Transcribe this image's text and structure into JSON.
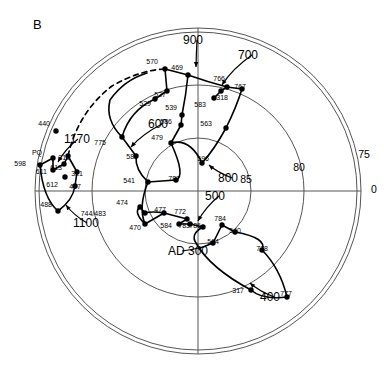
{
  "figure": {
    "panel_label": "B",
    "type": "polar-apw-plot",
    "center_px": [
      198,
      191
    ],
    "outer_radius_px": 163
  },
  "chart_data": {
    "type": "scatter",
    "title": "B",
    "projection": "polar-stereographic",
    "xlabel": "",
    "ylabel": "",
    "grid": true,
    "legend_position": "none",
    "axis_rings": [
      {
        "label": "85",
        "latitude": 85,
        "radius_px": 53,
        "label_px": [
          246,
          183
        ]
      },
      {
        "label": "80",
        "latitude": 80,
        "radius_px": 106,
        "label_px": [
          299,
          171
        ]
      },
      {
        "label": "75",
        "latitude": 75,
        "radius_px": 159,
        "label_px": [
          364,
          158
        ]
      }
    ],
    "axis_origin_label": {
      "label": "0",
      "px": [
        371,
        193
      ]
    },
    "era_labels": [
      {
        "label": "900",
        "px": [
          183,
          44
        ],
        "leader_to": [
          196,
          67
        ]
      },
      {
        "label": "700",
        "px": [
          238,
          59
        ],
        "leader_to": [
          222,
          85
        ]
      },
      {
        "label": "600",
        "px": [
          148,
          128
        ],
        "leader_to": [
          131,
          147
        ]
      },
      {
        "label": "800",
        "px": [
          218,
          182
        ],
        "leader_to": [
          209,
          165
        ]
      },
      {
        "label": "500",
        "px": [
          205,
          200
        ],
        "leader_to": [
          198,
          221
        ]
      },
      {
        "label": "400",
        "px": [
          260,
          301
        ],
        "leader_to": [
          250,
          283
        ]
      },
      {
        "label": "1170",
        "px": [
          64,
          143
        ],
        "leader_to": [
          58,
          162
        ]
      },
      {
        "label": "1100",
        "px": [
          73,
          227
        ],
        "leader_to": [
          66,
          205
        ]
      },
      {
        "label": "AD 300",
        "px": [
          168,
          255
        ],
        "leader_to": [
          203,
          247
        ]
      }
    ],
    "points": [
      {
        "label": "570",
        "px": [
          165,
          69
        ],
        "label_px": [
          158,
          64
        ]
      },
      {
        "label": "469",
        "px": [
          188,
          75
        ],
        "label_px": [
          183,
          70
        ]
      },
      {
        "label": "766",
        "px": [
          227,
          87
        ],
        "label_px": [
          225,
          81
        ]
      },
      {
        "label": "767",
        "px": [
          242,
          89
        ],
        "label_px": [
          246,
          89
        ]
      },
      {
        "label": "318",
        "px": [
          221,
          91
        ],
        "label_px": [
          228,
          100
        ]
      },
      {
        "label": "583",
        "px": [
          214,
          98
        ],
        "label_px": [
          206,
          107
        ]
      },
      {
        "label": "527",
        "px": [
          167,
          91
        ],
        "label_px": [
          166,
          97
        ]
      },
      {
        "label": "529",
        "px": [
          155,
          99
        ],
        "label_px": [
          151,
          106
        ]
      },
      {
        "label": "539",
        "px": [
          182,
          115
        ],
        "label_px": [
          177,
          110
        ]
      },
      {
        "label": "586",
        "px": [
          181,
          125
        ],
        "label_px": [
          172,
          124
        ]
      },
      {
        "label": "563",
        "px": [
          226,
          128
        ],
        "label_px": [
          212,
          126
        ]
      },
      {
        "label": "479",
        "px": [
          171,
          143
        ],
        "label_px": [
          163,
          140
        ]
      },
      {
        "label": "775",
        "px": [
          122,
          137
        ],
        "label_px": [
          106,
          145
        ]
      },
      {
        "label": "585",
        "px": [
          136,
          156
        ],
        "label_px": [
          138,
          159
        ]
      },
      {
        "label": "596",
        "px": [
          202,
          163
        ],
        "label_px": [
          209,
          161
        ]
      },
      {
        "label": "541",
        "px": [
          148,
          182
        ],
        "label_px": [
          135,
          183
        ]
      },
      {
        "label": "787",
        "px": [
          176,
          180
        ],
        "label_px": [
          180,
          181
        ]
      },
      {
        "label": "440",
        "px": [
          56,
          131
        ],
        "label_px": [
          50,
          126
        ]
      },
      {
        "label": "PQ",
        "px": [
          53,
          158
        ],
        "label_px": [
          42,
          155
        ]
      },
      {
        "label": "598",
        "px": [
          40,
          165
        ],
        "label_px": [
          26,
          166
        ]
      },
      {
        "label": "611",
        "px": [
          53,
          170
        ],
        "label_px": [
          47,
          174
        ]
      },
      {
        "label": "613",
        "px": [
          64,
          164
        ],
        "label_px": [
          62,
          170
        ]
      },
      {
        "label": "319",
        "px": [
          68,
          156
        ],
        "label_px": [
          70,
          160
        ]
      },
      {
        "label": "321",
        "px": [
          77,
          172
        ],
        "label_px": [
          83,
          176
        ]
      },
      {
        "label": "612",
        "px": [
          65,
          177
        ],
        "label_px": [
          58,
          187
        ]
      },
      {
        "label": "407",
        "px": [
          75,
          186
        ],
        "label_px": [
          81,
          189
        ]
      },
      {
        "label": "488",
        "px": [
          58,
          211
        ],
        "label_px": [
          52,
          207
        ]
      },
      {
        "label": "474",
        "px": [
          140,
          207
        ],
        "label_px": [
          128,
          205
        ]
      },
      {
        "label": "744/483",
        "px": [
          145,
          213
        ],
        "label_px": [
          106,
          216
        ]
      },
      {
        "label": "470",
        "px": [
          145,
          224
        ],
        "label_px": [
          141,
          230
        ]
      },
      {
        "label": "477",
        "px": [
          164,
          213
        ],
        "label_px": [
          166,
          212
        ]
      },
      {
        "label": "772",
        "px": [
          187,
          219
        ],
        "label_px": [
          186,
          214
        ]
      },
      {
        "label": "584",
        "px": [
          179,
          224
        ],
        "label_px": [
          172,
          228
        ]
      },
      {
        "label": "783",
        "px": [
          190,
          224
        ],
        "label_px": [
          190,
          228
        ]
      },
      {
        "label": "786",
        "px": [
          203,
          227
        ],
        "label_px": [
          201,
          228
        ]
      },
      {
        "label": "784",
        "px": [
          222,
          225
        ],
        "label_px": [
          226,
          221
        ]
      },
      {
        "label": "540",
        "px": [
          235,
          232
        ],
        "label_px": [
          241,
          233
        ]
      },
      {
        "label": "564",
        "px": [
          213,
          243
        ],
        "label_px": [
          219,
          244
        ]
      },
      {
        "label": "778",
        "px": [
          262,
          250
        ],
        "label_px": [
          268,
          251
        ]
      },
      {
        "label": "317",
        "px": [
          251,
          290
        ],
        "label_px": [
          244,
          293
        ]
      },
      {
        "label": "777",
        "px": [
          287,
          297
        ],
        "label_px": [
          292,
          296
        ]
      }
    ],
    "tracks": [
      {
        "name": "early-track-AD300-to-800",
        "style": "solid",
        "path": "M 203 247 L 213 243 L 222 225 L 235 232 Q 268 238 262 250 Q 280 268 287 297 Q 262 300 251 290 Q 210 268 196 243 Q 190 234 203 227"
      },
      {
        "name": "mid-track-500",
        "style": "solid",
        "path": "M 203 227 L 190 224 L 179 224 L 187 219 L 164 213 Q 152 211 145 213 L 140 207 Q 133 212 145 224 Q 152 220 164 213"
      },
      {
        "name": "track-470-541-787",
        "style": "solid",
        "path": "M 145 224 Q 138 207 148 182 L 176 180 Q 186 176 171 143"
      },
      {
        "name": "track-600-585-775",
        "style": "solid",
        "path": "M 148 182 Q 135 170 136 156 L 122 137 Q 130 110 155 99 L 167 91 L 165 69"
      },
      {
        "name": "track-479-586-539-469",
        "style": "solid",
        "path": "M 171 143 L 181 125 L 182 115 Q 186 95 188 75 L 165 69"
      },
      {
        "name": "track-596-563-767",
        "style": "solid",
        "path": "M 202 163 Q 214 150 226 128 Q 236 108 242 89 L 227 87 L 221 91 L 214 98"
      },
      {
        "name": "track-469-700-766",
        "style": "solid",
        "path": "M 188 75 Q 208 82 227 87"
      },
      {
        "name": "arc-479-596",
        "style": "solid",
        "path": "M 171 143 Q 190 138 202 163"
      },
      {
        "name": "track-leftwest-598-407",
        "style": "solid",
        "path": "M 40 165 L 53 158 L 53 170 L 64 164 L 68 156 L 77 172 L 75 186 Q 73 200 58 211 Q 43 198 40 165"
      },
      {
        "name": "track-1170-dashed-upper",
        "style": "dashed",
        "path": "M 68 156 Q 78 112 112 86 Q 140 70 165 69"
      },
      {
        "name": "track-600-inner-loop",
        "style": "solid",
        "path": "M 122 137 Q 105 120 110 100 Q 124 80 147 73"
      }
    ]
  }
}
